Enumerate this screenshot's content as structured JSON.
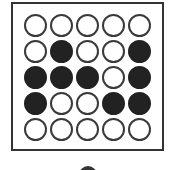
{
  "figure": {
    "rows": 5,
    "cols": 5,
    "grid": [
      [
        0,
        0,
        0,
        0,
        0
      ],
      [
        0,
        1,
        0,
        0,
        1
      ],
      [
        1,
        1,
        1,
        0,
        1
      ],
      [
        1,
        0,
        0,
        1,
        1
      ],
      [
        0,
        0,
        0,
        0,
        0
      ]
    ],
    "colors": {
      "filled": "#222222",
      "empty": "#ffffff",
      "outline": "#3a3a3a",
      "frame": "#333333"
    }
  }
}
